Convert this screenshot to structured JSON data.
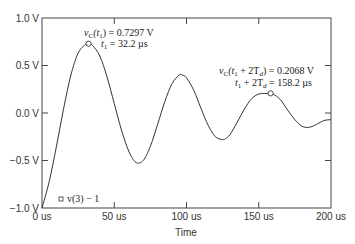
{
  "chart_data": {
    "type": "line",
    "title": "",
    "xlabel": "Time",
    "ylabel": "",
    "xlim": [
      0,
      200
    ],
    "ylim": [
      -1.0,
      1.0
    ],
    "grid": false,
    "x_ticks": [
      "0 us",
      "50 us",
      "100 us",
      "150 us",
      "200 us"
    ],
    "y_ticks": [
      "1.0 V",
      "0.5 V",
      "0.0 V",
      "-0.5 V",
      "-1.0 V"
    ],
    "legend": [
      {
        "marker": "square",
        "label": "v(3) - 1"
      }
    ],
    "series": [
      {
        "name": "v(3) - 1",
        "x": [
          0,
          5,
          10,
          15,
          20,
          25,
          30,
          32.2,
          35,
          40,
          45,
          50,
          55,
          60,
          65,
          70,
          75,
          80,
          85,
          90,
          95,
          97,
          100,
          105,
          110,
          115,
          120,
          125,
          127,
          130,
          135,
          140,
          145,
          150,
          155,
          158.2,
          160,
          165,
          170,
          175,
          180,
          185,
          190,
          195,
          200
        ],
        "y": [
          -1.0,
          -0.72,
          -0.35,
          0.05,
          0.4,
          0.63,
          0.72,
          0.7297,
          0.71,
          0.6,
          0.38,
          0.1,
          -0.18,
          -0.4,
          -0.52,
          -0.5,
          -0.35,
          -0.12,
          0.12,
          0.31,
          0.4,
          0.4,
          0.37,
          0.24,
          0.05,
          -0.13,
          -0.25,
          -0.28,
          -0.27,
          -0.23,
          -0.1,
          0.04,
          0.15,
          0.2,
          0.205,
          0.2068,
          0.2,
          0.14,
          0.03,
          -0.07,
          -0.14,
          -0.15,
          -0.12,
          -0.08,
          -0.07
        ]
      }
    ],
    "annotations": [
      {
        "marker": "circle",
        "x": 32.2,
        "y": 0.7297,
        "line1": "vC(t1) = 0.7297 V",
        "line2": "t1 = 32.2 µs"
      },
      {
        "marker": "circle",
        "x": 158.2,
        "y": 0.2068,
        "line1": "vC(t1 + 2Td) = 0.2068 V",
        "line2": "t1 + 2Td = 158.2 µs"
      }
    ]
  },
  "labels": {
    "x_title": "Time",
    "legend": "v(3) − 1",
    "ann1_line1_a": "v",
    "ann1_line1_b": "C",
    "ann1_line1_c": "(t",
    "ann1_line1_d": "1",
    "ann1_line1_e": ") = 0.7297 V",
    "ann1_line2_a": "t",
    "ann1_line2_b": "1",
    "ann1_line2_c": " = 32.2 µs",
    "ann2_line1_a": "v",
    "ann2_line1_b": "C",
    "ann2_line1_c": "(t",
    "ann2_line1_d": "1",
    "ann2_line1_e": " + 2T",
    "ann2_line1_f": "d",
    "ann2_line1_g": ") = 0.2068 V",
    "ann2_line2_a": "t",
    "ann2_line2_b": "1",
    "ann2_line2_c": " + 2T",
    "ann2_line2_d": "d",
    "ann2_line2_e": " = 158.2 µs"
  }
}
